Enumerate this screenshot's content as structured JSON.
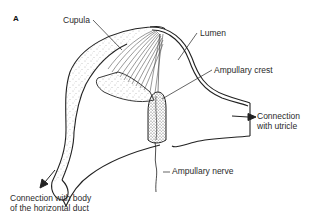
{
  "figure": {
    "panel_letter": "A",
    "labels": {
      "cupula": "Cupula",
      "lumen": "Lumen",
      "ampullary_crest": "Ampullary crest",
      "utricle_line1": "Connection",
      "utricle_line2": "with utricle",
      "ampullary_nerve": "Ampullary nerve",
      "duct_line1": "Connection with body",
      "duct_line2": "of the horizontal duct"
    },
    "colors": {
      "outline": "#222222",
      "stipple": "#555555",
      "background": "#ffffff"
    }
  }
}
